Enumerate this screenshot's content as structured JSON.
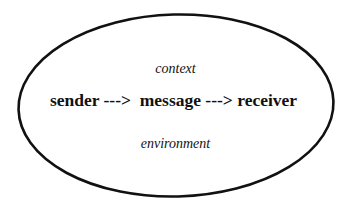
{
  "diagram": {
    "type": "communication-model",
    "boundary": {
      "shape": "ellipse",
      "stroke_color": "#111111",
      "fill_color": "#ffffff"
    },
    "labels": {
      "top": "context",
      "main": "sender --->  message ---> receiver",
      "bottom": "environment"
    },
    "flow": [
      {
        "node": "sender"
      },
      {
        "connector": "--->"
      },
      {
        "node": "message"
      },
      {
        "connector": "--->"
      },
      {
        "node": "receiver"
      }
    ]
  }
}
